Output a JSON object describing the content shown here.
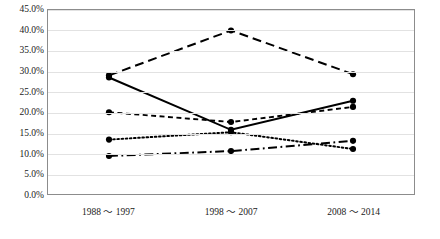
{
  "chart_data": {
    "type": "line",
    "title": "",
    "xlabel": "",
    "ylabel": "",
    "categories": [
      "1988 ～ 1997",
      "1998 ～ 2007",
      "2008 ～ 2014"
    ],
    "ylim": [
      0,
      45
    ],
    "ytick_labels": [
      "45.0%",
      "40.0%",
      "35.0%",
      "30.0%",
      "25.0%",
      "20.0%",
      "15.0%",
      "10.0%",
      "5.0%",
      "0.0%"
    ],
    "ytick_values": [
      45,
      40,
      35,
      30,
      25,
      20,
      15,
      10,
      5,
      0
    ],
    "grid": true,
    "legend": "none",
    "series": [
      {
        "name": "series-1-solid",
        "style": "solid",
        "values": [
          28.5,
          15.7,
          22.8
        ]
      },
      {
        "name": "series-2-long-dash",
        "style": "long-dash",
        "values": [
          29.0,
          40.0,
          29.3
        ]
      },
      {
        "name": "series-3-short-dash",
        "style": "short-dash",
        "values": [
          20.0,
          17.6,
          21.3
        ]
      },
      {
        "name": "series-4-dotted",
        "style": "dotted",
        "values": [
          13.3,
          15.1,
          11.0
        ]
      },
      {
        "name": "series-5-dash-dot",
        "style": "dash-dot",
        "values": [
          9.3,
          10.5,
          13.0
        ]
      }
    ],
    "line_color": "#000000",
    "marker": "circle",
    "axis_color": "#8c8c8c",
    "grid_color": "#e2e2e2"
  }
}
